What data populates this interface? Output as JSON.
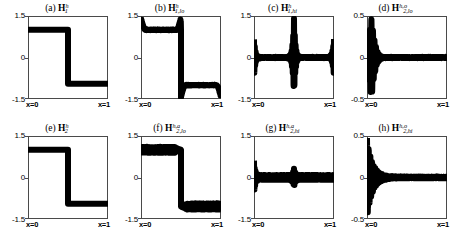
{
  "figure": {
    "background": "#ffffff",
    "line_color": "#000000",
    "axis_color": "#4a4a4a",
    "rows": 2,
    "cols": 4
  },
  "axis_labels": {
    "x_left": "x=0",
    "x_right": "x=1"
  },
  "chart_data": [
    {
      "type": "line",
      "panel": "a",
      "title_label": "(a)",
      "symbol_base": "H",
      "symbol_sub": "1",
      "symbol_sup": "h",
      "title_plain": "(a) H_1^h",
      "xlabel": "",
      "ylabel": "",
      "xlim": [
        0,
        1
      ],
      "ylim": [
        -1.5,
        1.5
      ],
      "yticks": [
        "1.5",
        "0",
        "-1.5"
      ],
      "ytick_values": [
        1.5,
        0,
        -1.5
      ],
      "xticks": [
        "x=0",
        "x=1"
      ],
      "grid": false,
      "description": "clean square step: +1.0 on left half, -1.0 on right half, sharp jump at x=0.5",
      "x": [
        0.0,
        0.02,
        0.1,
        0.2,
        0.3,
        0.4,
        0.49,
        0.5,
        0.51,
        0.6,
        0.7,
        0.8,
        0.9,
        0.98,
        1.0
      ],
      "y": [
        1.0,
        1.0,
        1.0,
        1.0,
        1.0,
        1.0,
        1.0,
        0.0,
        -0.95,
        -0.95,
        -0.95,
        -0.95,
        -0.95,
        -0.95,
        -0.95
      ]
    },
    {
      "type": "line",
      "panel": "b",
      "title_label": "(b)",
      "symbol_base": "H",
      "symbol_sub": "1,lo",
      "symbol_sup": "h",
      "title_plain": "(b) H_{1,lo}^h",
      "xlabel": "",
      "ylabel": "",
      "xlim": [
        0,
        1
      ],
      "ylim": [
        -1.5,
        1.5
      ],
      "yticks": [
        "1.5",
        "0",
        "-1.5"
      ],
      "ytick_values": [
        1.5,
        0,
        -1.5
      ],
      "xticks": [
        "x=0",
        "x=1"
      ],
      "grid": false,
      "description": "low-pass filtered step with Gibbs overshoot spikes to +/-1.45 at x=0, x=0.5 and x=1 edges",
      "x": [
        0.0,
        0.5,
        1.0
      ],
      "y": [
        1.0,
        0.0,
        -1.0
      ],
      "overshoot": 1.45
    },
    {
      "type": "line",
      "panel": "c",
      "title_label": "(c)",
      "symbol_base": "H",
      "symbol_sub": "1,hi",
      "symbol_sup": "h",
      "title_plain": "(c) H_{1,hi}^h",
      "xlabel": "",
      "ylabel": "",
      "xlim": [
        0,
        1
      ],
      "ylim": [
        -1.5,
        1.5
      ],
      "yticks": [
        "1.5",
        "0",
        "-1.5"
      ],
      "ytick_values": [
        1.5,
        0,
        -1.5
      ],
      "xticks": [
        "x=0",
        "x=1"
      ],
      "grid": false,
      "description": "high-pass residual: near zero everywhere with large localized oscillatory bursts at x=0, x=0.5 and x=1",
      "burst_positions": [
        0.0,
        0.5,
        1.0
      ],
      "burst_amplitudes": [
        0.75,
        1.45,
        0.75
      ],
      "baseline": 0.0
    },
    {
      "type": "line",
      "panel": "d",
      "title_label": "(d)",
      "symbol_base": "H",
      "symbol_sub": "2,lo",
      "symbol_sup": "h,o",
      "title_plain": "(d) H_{2,lo}^{h,o}",
      "xlabel": "",
      "ylabel": "",
      "xlim": [
        0,
        1
      ],
      "ylim": [
        -0.5,
        0.5
      ],
      "yticks": [
        "0.5",
        "0",
        "-0.5"
      ],
      "ytick_values": [
        0.5,
        0,
        -0.5
      ],
      "xticks": [
        "x=0",
        "x=1"
      ],
      "grid": false,
      "description": "decaying oscillatory burst centered near x=0.07 with peak amplitude 0.48, flat near zero for x > 0.35",
      "burst_positions": [
        0.07
      ],
      "burst_amplitudes": [
        0.48
      ],
      "baseline": 0.0
    },
    {
      "type": "line",
      "panel": "e",
      "title_label": "(e)",
      "symbol_base": "H",
      "symbol_sub": "2",
      "symbol_sup": "h",
      "title_plain": "(e) H_2^h",
      "xlabel": "",
      "ylabel": "",
      "xlim": [
        0,
        1
      ],
      "ylim": [
        -1.5,
        1.5
      ],
      "yticks": [
        "1.5",
        "0",
        "-1.5"
      ],
      "ytick_values": [
        1.5,
        0,
        -1.5
      ],
      "xticks": [
        "x=0",
        "x=1"
      ],
      "grid": false,
      "description": "clean square step: +1.0 on left half, -1.0 on right half, sharp jump at x=0.5",
      "x": [
        0.0,
        0.02,
        0.1,
        0.2,
        0.3,
        0.4,
        0.49,
        0.5,
        0.51,
        0.6,
        0.7,
        0.8,
        0.9,
        0.98,
        1.0
      ],
      "y": [
        1.0,
        1.0,
        1.0,
        1.0,
        1.0,
        1.0,
        1.0,
        0.0,
        -0.95,
        -0.95,
        -0.95,
        -0.95,
        -0.95,
        -0.95,
        -0.95
      ]
    },
    {
      "type": "line",
      "panel": "f",
      "title_label": "(f)",
      "symbol_base": "H",
      "symbol_sub": "2,lo",
      "symbol_sup": "h,a",
      "title_plain": "(f) H_{2,lo}^{h,a}",
      "xlabel": "",
      "ylabel": "",
      "xlim": [
        0,
        1
      ],
      "ylim": [
        -1.5,
        1.5
      ],
      "yticks": [
        "1.5",
        "0",
        "-1.5"
      ],
      "ytick_values": [
        1.5,
        0,
        -1.5
      ],
      "xticks": [
        "x=0",
        "x=1"
      ],
      "grid": false,
      "description": "step with small uniform sawtooth ripple riding on the plateaus, amplitude about 0.12, jump at x=0.5",
      "x": [
        0.0,
        0.5,
        1.0
      ],
      "y": [
        1.0,
        0.0,
        -1.0
      ],
      "ripple_amplitude": 0.12
    },
    {
      "type": "line",
      "panel": "g",
      "title_label": "(g)",
      "symbol_base": "H",
      "symbol_sub": "2,hi",
      "symbol_sup": "h,a",
      "title_plain": "(g) H_{2,hi}^{h,a}",
      "xlabel": "",
      "ylabel": "",
      "xlim": [
        0,
        1
      ],
      "ylim": [
        -1.5,
        1.5
      ],
      "yticks": [
        "1.5",
        "0",
        "-1.5"
      ],
      "ytick_values": [
        1.5,
        0,
        -1.5
      ],
      "xticks": [
        "x=0",
        "x=1"
      ],
      "grid": false,
      "description": "high-pass residual: dense small ripple about zero across domain with a tall burst at x=0 (amplitude 0.55) and a moderate burst near x=0.5",
      "burst_positions": [
        0.0,
        0.5
      ],
      "burst_amplitudes": [
        0.55,
        0.3
      ],
      "ripple_amplitude": 0.1,
      "baseline": 0.0
    },
    {
      "type": "line",
      "panel": "h",
      "title_label": "(h)",
      "symbol_base": "H",
      "symbol_sub": "2,hi",
      "symbol_sup": "h,o",
      "title_plain": "(h) H_{2,hi}^{h,o}",
      "xlabel": "",
      "ylabel": "",
      "xlim": [
        0,
        1
      ],
      "ylim": [
        -0.5,
        0.5
      ],
      "yticks": [
        "0.5",
        "0",
        "-0.5"
      ],
      "ytick_values": [
        0.5,
        0,
        -0.5
      ],
      "xticks": [
        "x=0",
        "x=1"
      ],
      "grid": false,
      "description": "decaying oscillatory burst starting at x=0 with peak amplitude 0.45, decaying to near zero by x=0.45",
      "burst_positions": [
        0.02
      ],
      "burst_amplitudes": [
        0.45
      ],
      "baseline": 0.0
    }
  ]
}
